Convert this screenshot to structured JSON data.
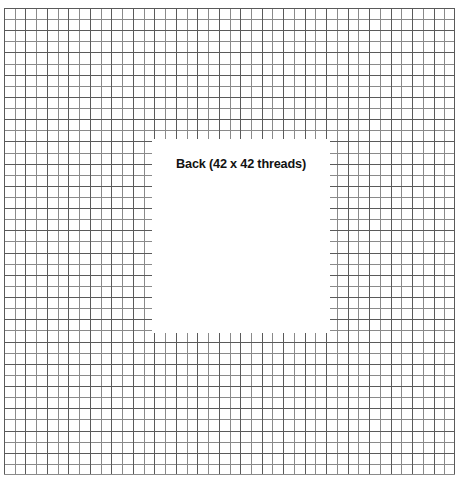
{
  "diagram": {
    "title": "Back (42 x 42 threads)",
    "type": "cross-stitch-thread-grid",
    "label_text": "Back (42 x 42 threads)",
    "grid": {
      "threads_horizontal": 42,
      "threads_vertical": 42,
      "cell_width_px": 10.74,
      "cell_height_px": 11.12,
      "line_color": "#8a8a8a",
      "emphasis_line_color": "#5a5a5a",
      "background_color": "#ffffff",
      "bounds": {
        "left": 4,
        "top": 8,
        "width": 451,
        "height": 467
      }
    },
    "back_panel": {
      "name": "Back",
      "threads_across": 42,
      "threads_down": 42,
      "fill_color": "#ffffff",
      "text_color": "#121212",
      "bounds": {
        "left": 152,
        "top": 139,
        "width": 178,
        "height": 194
      }
    }
  },
  "chart_data": {
    "type": "table",
    "title": "Back (42 x 42 threads)",
    "xlabel": "threads (horizontal)",
    "ylabel": "threads (vertical)",
    "categories": [
      "threads_horizontal",
      "threads_vertical"
    ],
    "values": [
      42,
      42
    ],
    "grid": "on",
    "legend": "none"
  }
}
